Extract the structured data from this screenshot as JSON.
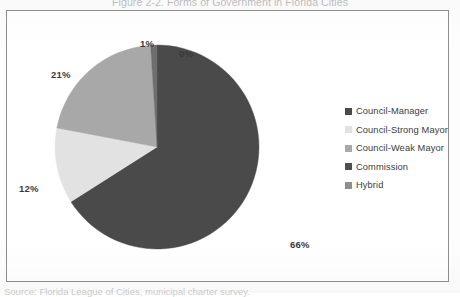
{
  "figure": {
    "title": "Figure 2-2. Forms of Government in Florida Cities",
    "caption": "Source: Florida League of Cities, municipal charter survey.",
    "border_color": "#8e8e8e",
    "background": "#ffffff"
  },
  "chart_data": {
    "type": "pie",
    "title": "Figure 2-2. Forms of Government in Florida Cities",
    "xlabel": "",
    "ylabel": "",
    "legend_position": "right",
    "grid": false,
    "start_angle_deg": 0,
    "direction": "clockwise",
    "categories": [
      "Council-Manager",
      "Council-Strong Mayor",
      "Council-Weak Mayor",
      "Commission",
      "Hybrid"
    ],
    "values": [
      66,
      12,
      21,
      1,
      0
    ],
    "data_labels": [
      "66%",
      "12%",
      "21%",
      "1%",
      "0%"
    ],
    "colors": [
      "#4a4a4a",
      "#e2e2e2",
      "#a8a8a8",
      "#6e6e6e",
      "#8f8f8f"
    ],
    "slices": [
      {
        "label": "Council-Manager",
        "value": 66,
        "data_label": "66%",
        "color": "#4a4a4a"
      },
      {
        "label": "Council-Strong Mayor",
        "value": 12,
        "data_label": "12%",
        "color": "#e2e2e2"
      },
      {
        "label": "Council-Weak Mayor",
        "value": 21,
        "data_label": "21%",
        "color": "#a8a8a8"
      },
      {
        "label": "Commission",
        "value": 1,
        "data_label": "1%",
        "color": "#6e6e6e"
      },
      {
        "label": "Hybrid",
        "value": 0,
        "data_label": "0%",
        "color": "#8f8f8f"
      }
    ]
  },
  "labels": {
    "pct_0": "0%",
    "pct_1": "1%",
    "pct_21": "21%",
    "pct_12": "12%",
    "pct_66": "66%"
  },
  "legend": {
    "items": [
      {
        "label": "Council-Manager",
        "color": "#4a4a4a"
      },
      {
        "label": "Council-Strong Mayor",
        "color": "#e2e2e2"
      },
      {
        "label": "Council-Weak Mayor",
        "color": "#a8a8a8"
      },
      {
        "label": "Commission",
        "color": "#4f4f4f"
      },
      {
        "label": "Hybrid",
        "color": "#8f8f8f"
      }
    ]
  }
}
